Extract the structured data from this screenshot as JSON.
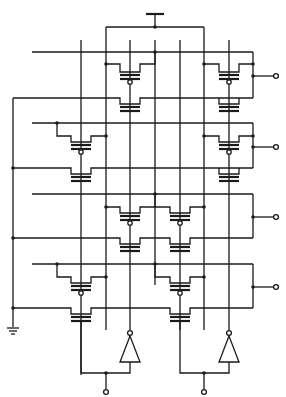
{
  "diagram": {
    "type": "transistor-array-schematic",
    "colors": {
      "line": "#1a1a1a",
      "background": "#ffffff"
    },
    "rows": 4,
    "cells": [
      {
        "row": 1,
        "columns": [
          2,
          4
        ]
      },
      {
        "row": 2,
        "columns": [
          1,
          4
        ]
      },
      {
        "row": 3,
        "columns": [
          2,
          3
        ]
      },
      {
        "row": 4,
        "columns": [
          1,
          3
        ]
      }
    ],
    "outputs": [
      "row-1-output",
      "row-2-output",
      "row-3-output",
      "row-4-output"
    ],
    "bottom_terminals": [
      "left-inverter-output",
      "right-inverter-output"
    ],
    "symbols": [
      "power-supply-icon",
      "ground-icon",
      "inverter-icon",
      "inverter-icon"
    ],
    "labels": []
  }
}
